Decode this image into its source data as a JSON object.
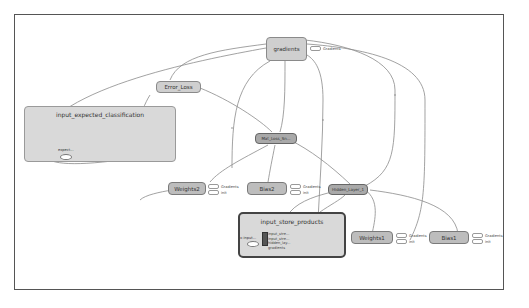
{
  "graph": {
    "nodes": {
      "gradients": {
        "label": "gradients"
      },
      "error_loss": {
        "label": "Error_Loss"
      },
      "mid_op": {
        "label": "Mat_Loss_Sn..."
      },
      "weights2": {
        "label": "Weights2"
      },
      "bias2": {
        "label": "Bias2"
      },
      "hidden_layer": {
        "label": "Hidden_Layer_1"
      },
      "weights1": {
        "label": "Weights1"
      },
      "bias1": {
        "label": "Bias1"
      }
    },
    "groups": {
      "expected": {
        "title": "input_expected_classification",
        "inner_label": "expect..."
      },
      "store_products": {
        "title": "input_store_products",
        "inner_label": "x-input...",
        "outputs": [
          "input_stre...",
          "input_stre...",
          "hidden_lay...",
          "gradients"
        ]
      }
    },
    "annotations": {
      "gradients": [
        "Gradients"
      ],
      "weights2": [
        "Gradients",
        "init"
      ],
      "bias2": [
        "Gradients",
        "init"
      ],
      "weights1": [
        "Gradients",
        "init"
      ],
      "bias1": [
        "Gradients",
        "init"
      ]
    }
  },
  "colors": {
    "frame": "#555555",
    "node_fill": "#bdbdbd",
    "group_fill": "#d9d9d9",
    "edge": "#8a8a8a"
  }
}
